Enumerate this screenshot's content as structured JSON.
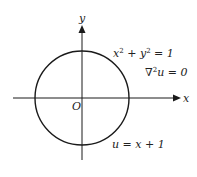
{
  "diagram": {
    "type": "geometry",
    "axes": {
      "x_label": "x",
      "y_label": "y",
      "origin_label": "O"
    },
    "circle": {
      "equation_base": "x",
      "center": [
        0,
        0
      ],
      "radius": 1
    },
    "labels": {
      "circle_eq_part1": "x",
      "circle_eq_plus": " + y",
      "circle_eq_rhs": " = 1",
      "sup2": "2",
      "laplace_nabla": "∇",
      "laplace_rest": "u = 0",
      "boundary": "u = x + 1"
    },
    "colors": {
      "stroke": "#1a1a1a",
      "text": "#222222"
    }
  }
}
